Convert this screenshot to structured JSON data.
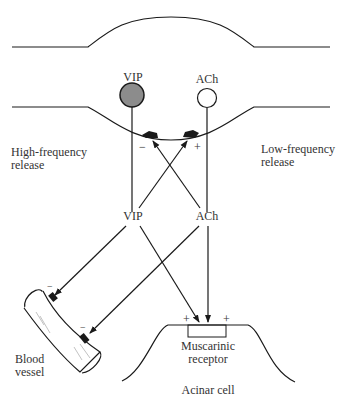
{
  "diagram": {
    "neurons": {
      "vip_terminal_label": "VIP",
      "ach_terminal_label": "ACh"
    },
    "release": {
      "high_frequency": [
        "High-frequency",
        "release"
      ],
      "low_frequency": [
        "Low-frequency",
        "release"
      ]
    },
    "presynaptic_signs": {
      "vip_side": "−",
      "ach_side": "+"
    },
    "transmitters": {
      "vip": "VIP",
      "ach": "ACh"
    },
    "targets": {
      "blood_vessel": [
        "Blood",
        "vessel"
      ],
      "blood_vessel_signs": [
        "−",
        "−"
      ],
      "receptor": [
        "Muscarinic",
        "receptor"
      ],
      "receptor_signs": [
        "+",
        "+"
      ],
      "acinar_cell": "Acinar cell"
    },
    "colors": {
      "line": "#1a1a1a",
      "vip_fill": "#8c8c8c",
      "ach_fill": "#ffffff",
      "text": "#333333"
    }
  }
}
